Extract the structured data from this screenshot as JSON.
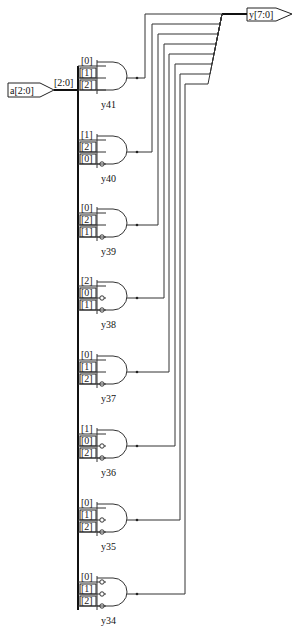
{
  "input_port": {
    "label": "a[2:0]",
    "bus_label": "[2:0]"
  },
  "output_port": {
    "label": "y[7:0]"
  },
  "gates": [
    {
      "name": "y41",
      "pins": [
        "[0]",
        "[1]",
        "[2]"
      ],
      "inverted": [
        false,
        false,
        false
      ],
      "y": 78,
      "wire_x": 145
    },
    {
      "name": "y40",
      "pins": [
        "[1]",
        "[2]",
        "[0]"
      ],
      "inverted": [
        false,
        false,
        true
      ],
      "y": 152,
      "wire_x": 152
    },
    {
      "name": "y39",
      "pins": [
        "[0]",
        "[2]",
        "[1]"
      ],
      "inverted": [
        false,
        false,
        true
      ],
      "y": 225,
      "wire_x": 158
    },
    {
      "name": "y38",
      "pins": [
        "[2]",
        "[0]",
        "[1]"
      ],
      "inverted": [
        false,
        true,
        true
      ],
      "y": 298,
      "wire_x": 164
    },
    {
      "name": "y37",
      "pins": [
        "[0]",
        "[1]",
        "[2]"
      ],
      "inverted": [
        false,
        false,
        true
      ],
      "y": 372,
      "wire_x": 169
    },
    {
      "name": "y36",
      "pins": [
        "[1]",
        "[0]",
        "[2]"
      ],
      "inverted": [
        false,
        true,
        true
      ],
      "y": 446,
      "wire_x": 175
    },
    {
      "name": "y35",
      "pins": [
        "[0]",
        "[1]",
        "[2]"
      ],
      "inverted": [
        false,
        true,
        true
      ],
      "y": 520,
      "wire_x": 180
    },
    {
      "name": "y34",
      "pins": [
        "[0]",
        "[1]",
        "[2]"
      ],
      "inverted": [
        true,
        true,
        true
      ],
      "y": 594,
      "wire_x": 185
    }
  ]
}
